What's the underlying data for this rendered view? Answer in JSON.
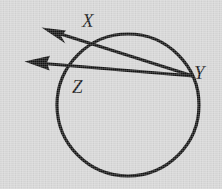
{
  "figure": {
    "kind": "circle-with-two-rays",
    "background_color": "#d6d6d6",
    "ink_color": "#131313",
    "canvas": {
      "width": 222,
      "height": 189
    },
    "circle": {
      "name": "circle-Z",
      "center_x": 128,
      "center_y": 105,
      "radius": 71,
      "stroke_width": 3.2
    },
    "rays": [
      {
        "name": "ray-YX",
        "from_label": "Y",
        "through_label": "X",
        "start_x": 193,
        "start_y": 76,
        "end_x": 42,
        "end_y": 28,
        "stroke_width": 3.0,
        "arrowhead": "open-barbed"
      },
      {
        "name": "ray-YZ",
        "from_label": "Y",
        "through_label": "Z",
        "start_x": 193,
        "start_y": 76,
        "end_x": 25,
        "end_y": 62,
        "stroke_width": 3.0,
        "arrowhead": "open-barbed"
      }
    ],
    "labels": [
      {
        "id": "X",
        "text": "X",
        "x": 88,
        "y": 22,
        "role": "point-on-circle"
      },
      {
        "id": "Y",
        "text": "Y",
        "x": 200,
        "y": 73,
        "role": "point-on-circle"
      },
      {
        "id": "Z",
        "text": "Z",
        "x": 78,
        "y": 87,
        "role": "circle-center-name"
      }
    ]
  }
}
